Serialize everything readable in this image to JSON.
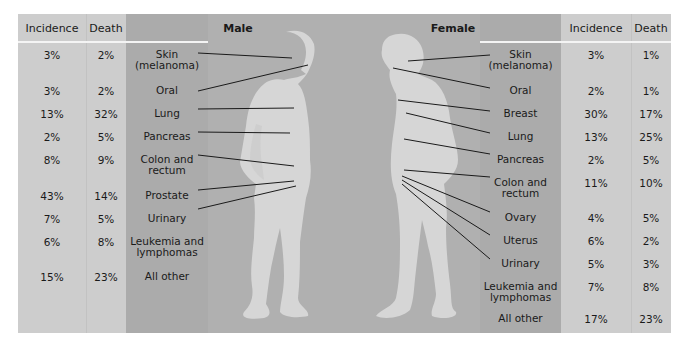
{
  "figure": {
    "male_title": "Male",
    "female_title": "Female"
  },
  "headers": {
    "incidence": "Incidence",
    "death": "Death"
  },
  "male": [
    {
      "site": "Skin",
      "site2": "(melanoma)",
      "incidence": "3%",
      "death": "2%"
    },
    {
      "site": "Oral",
      "site2": "",
      "incidence": "3%",
      "death": "2%"
    },
    {
      "site": "Lung",
      "site2": "",
      "incidence": "13%",
      "death": "32%"
    },
    {
      "site": "Pancreas",
      "site2": "",
      "incidence": "2%",
      "death": "5%"
    },
    {
      "site": "Colon and",
      "site2": "rectum",
      "incidence": "8%",
      "death": "9%"
    },
    {
      "site": "Prostate",
      "site2": "",
      "incidence": "43%",
      "death": "14%"
    },
    {
      "site": "Urinary",
      "site2": "",
      "incidence": "7%",
      "death": "5%"
    },
    {
      "site": "Leukemia and",
      "site2": "lymphomas",
      "incidence": "6%",
      "death": "8%"
    },
    {
      "site": "All other",
      "site2": "",
      "incidence": "15%",
      "death": "23%"
    }
  ],
  "female": [
    {
      "site": "Skin",
      "site2": "(melanoma)",
      "incidence": "3%",
      "death": "1%"
    },
    {
      "site": "Oral",
      "site2": "",
      "incidence": "2%",
      "death": "1%"
    },
    {
      "site": "Breast",
      "site2": "",
      "incidence": "30%",
      "death": "17%"
    },
    {
      "site": "Lung",
      "site2": "",
      "incidence": "13%",
      "death": "25%"
    },
    {
      "site": "Pancreas",
      "site2": "",
      "incidence": "2%",
      "death": "5%"
    },
    {
      "site": "Colon and",
      "site2": "rectum",
      "incidence": "11%",
      "death": "10%"
    },
    {
      "site": "Ovary",
      "site2": "",
      "incidence": "4%",
      "death": "5%"
    },
    {
      "site": "Uterus",
      "site2": "",
      "incidence": "6%",
      "death": "2%"
    },
    {
      "site": "Urinary",
      "site2": "",
      "incidence": "5%",
      "death": "3%"
    },
    {
      "site": "Leukemia and",
      "site2": "lymphomas",
      "incidence": "7%",
      "death": "8%"
    },
    {
      "site": "All other",
      "site2": "",
      "incidence": "17%",
      "death": "23%"
    }
  ],
  "colors": {
    "panel_light": "#cdcdcd",
    "panel_dark": "#ababab",
    "figure_bg": "#b0b0b0",
    "silhouette": "#d6d6d6",
    "leader_line": "#1a1a1a"
  }
}
